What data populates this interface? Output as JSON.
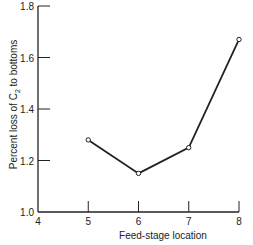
{
  "chart_data": {
    "type": "line",
    "title": "",
    "xlabel": "Feed-stage location",
    "ylabel_parts": [
      "Percent loss of C",
      "2",
      " to bottoms"
    ],
    "ylabel": "Percent loss of C2 to bottoms",
    "x": [
      5,
      6,
      7,
      8
    ],
    "values": [
      1.28,
      1.15,
      1.25,
      1.67
    ],
    "series": [
      {
        "name": "Percent loss of C2 to bottoms",
        "x": [
          5,
          6,
          7,
          8
        ],
        "values": [
          1.28,
          1.15,
          1.25,
          1.67
        ]
      }
    ],
    "xlim": [
      4,
      8
    ],
    "ylim": [
      1.0,
      1.8
    ],
    "xticks": [
      "4",
      "5",
      "6",
      "7",
      "8"
    ],
    "yticks": [
      "1.0",
      "1.2",
      "1.4",
      "1.6",
      "1.8"
    ],
    "grid": false,
    "legend": null,
    "marker": "open-circle",
    "line_color": "#222222"
  }
}
